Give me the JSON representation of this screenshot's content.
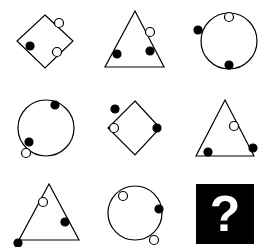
{
  "puzzle": {
    "type": "3x3 matrix reasoning puzzle",
    "rows": 3,
    "cols": 3,
    "cells": [
      {
        "row": 1,
        "col": 1,
        "shape": "diamond",
        "black_dots": 1,
        "white_dots": 2
      },
      {
        "row": 1,
        "col": 2,
        "shape": "triangle",
        "black_dots": 2,
        "white_dots": 1
      },
      {
        "row": 1,
        "col": 3,
        "shape": "circle",
        "black_dots": 2,
        "white_dots": 1
      },
      {
        "row": 2,
        "col": 1,
        "shape": "circle",
        "black_dots": 2,
        "white_dots": 1
      },
      {
        "row": 2,
        "col": 2,
        "shape": "diamond",
        "black_dots": 2,
        "white_dots": 1
      },
      {
        "row": 2,
        "col": 3,
        "shape": "triangle",
        "black_dots": 2,
        "white_dots": 1
      },
      {
        "row": 3,
        "col": 1,
        "shape": "triangle",
        "black_dots": 2,
        "white_dots": 1
      },
      {
        "row": 3,
        "col": 2,
        "shape": "circle",
        "black_dots": 1,
        "white_dots": 2
      },
      {
        "row": 3,
        "col": 3,
        "shape": "unknown",
        "label": "?"
      }
    ],
    "question_mark": "?",
    "colors": {
      "stroke": "#000000",
      "fill_black": "#000000",
      "fill_white": "#ffffff",
      "question_bg": "#000000",
      "question_fg": "#ffffff"
    }
  }
}
